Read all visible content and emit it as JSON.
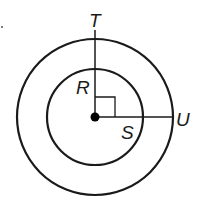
{
  "diagram": {
    "type": "concentric-circles",
    "center": {
      "x": 95,
      "y": 117
    },
    "outer_radius": 78,
    "inner_radius": 48,
    "stroke_color": "#1a1a1a",
    "labels": {
      "T": "T",
      "R": "R",
      "S": "S",
      "U": "U"
    },
    "right_angle_marker": true
  }
}
